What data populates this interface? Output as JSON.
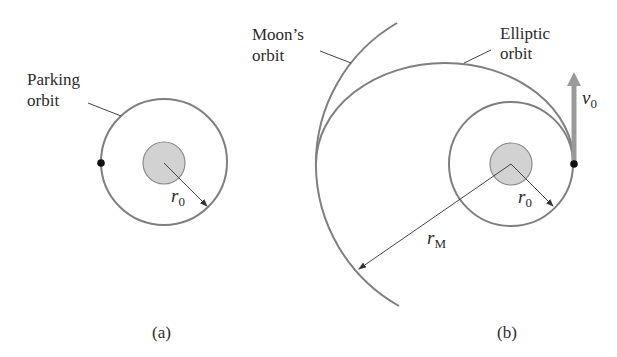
{
  "figure": {
    "panel_a": {
      "caption": "(a)",
      "orbit_label_line1": "Parking",
      "orbit_label_line2": "orbit",
      "radius_symbol": "r",
      "radius_subscript": "0"
    },
    "panel_b": {
      "caption": "(b)",
      "moon_label_line1": "Moon’s",
      "moon_label_line2": "orbit",
      "ellipse_label_line1": "Elliptic",
      "ellipse_label_line2": "orbit",
      "radius_symbol": "r",
      "radius_subscript": "0",
      "moon_radius_symbol": "r",
      "moon_radius_subscript": "M",
      "velocity_symbol": "v",
      "velocity_subscript": "0"
    },
    "colors": {
      "orbit_stroke": "#7f7f7f",
      "earth_fill": "#d2d2d2",
      "velocity_arrow": "#9a9a9a",
      "text": "#2b2b2b"
    }
  }
}
